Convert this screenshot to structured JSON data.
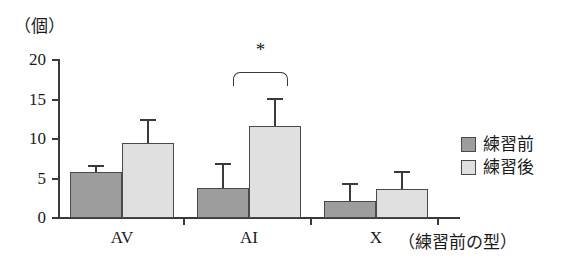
{
  "chart_data": {
    "type": "bar",
    "title": "",
    "subtitle": "",
    "xlabel": "X（練習前の型）",
    "ylabel": "（個）",
    "categories": [
      "AV",
      "AI",
      "X"
    ],
    "ylim": [
      0,
      20
    ],
    "yticks": [
      0,
      5,
      10,
      15,
      20
    ],
    "ytick_labels": [
      "0",
      "5",
      "10",
      "15",
      "20"
    ],
    "grid": false,
    "legend_position": "right",
    "series": [
      {
        "name": "練習前",
        "color": "#9d9d9d",
        "values": [
          5.8,
          3.8,
          2.2
        ],
        "errors": [
          0.9,
          3.1,
          2.2
        ]
      },
      {
        "name": "練習後",
        "color": "#e0e0e0",
        "values": [
          9.5,
          11.6,
          3.7
        ],
        "errors": [
          3.0,
          3.6,
          2.2
        ]
      }
    ],
    "annotations": [
      {
        "type": "significance-bracket",
        "label": "*",
        "from_category": "AI",
        "from_series": "練習前",
        "to_category": "AI",
        "to_series": "練習後"
      }
    ]
  },
  "axis": {
    "unit_label": "（個）",
    "x_caption": "（練習前の型）"
  },
  "legend": {
    "items": [
      {
        "label": "練習前"
      },
      {
        "label": "練習後"
      }
    ]
  }
}
